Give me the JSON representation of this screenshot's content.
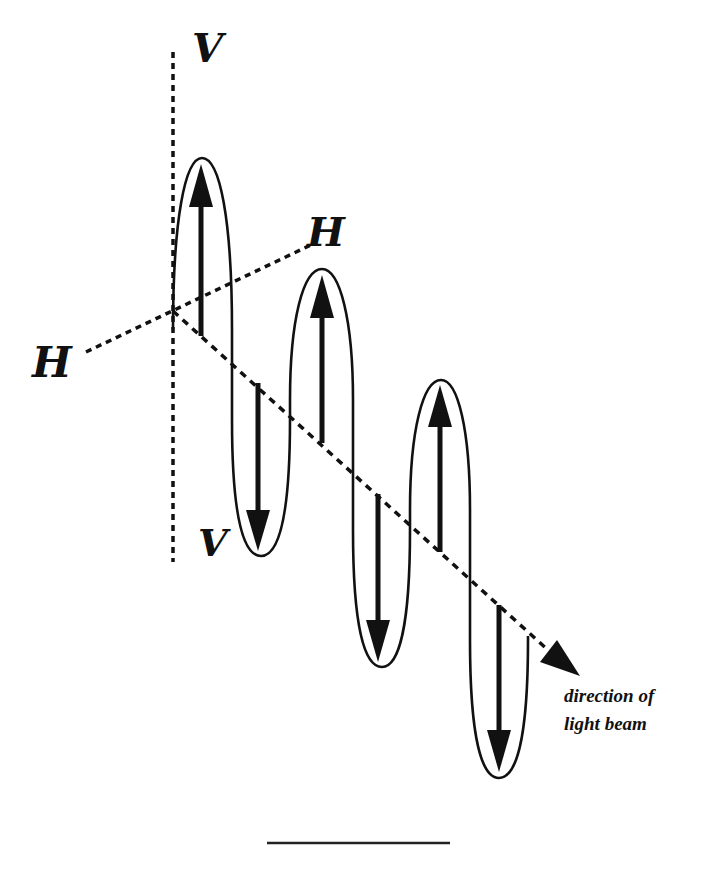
{
  "diagram": {
    "labels": {
      "v_top": "V",
      "v_bottom": "V",
      "h_right": "H",
      "h_left": "H"
    },
    "caption": {
      "line1": "direction of",
      "line2": "light beam"
    },
    "colors": {
      "stroke": "#111111",
      "background": "#ffffff"
    },
    "axes": {
      "vertical": "V-V plane (vertical)",
      "horizontal": "H-H plane (horizontal)",
      "beam": "direction of propagation"
    },
    "lobes": [
      {
        "index": 1,
        "direction": "up"
      },
      {
        "index": 2,
        "direction": "down"
      },
      {
        "index": 3,
        "direction": "up"
      },
      {
        "index": 4,
        "direction": "down"
      },
      {
        "index": 5,
        "direction": "up"
      },
      {
        "index": 6,
        "direction": "down"
      }
    ]
  }
}
